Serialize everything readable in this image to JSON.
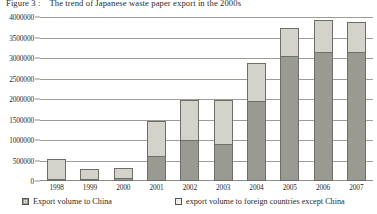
{
  "figure": {
    "caption_number": "Figure 3 :",
    "caption_text": "The trend of Japanese waste paper export in the 2000s"
  },
  "legend": {
    "china": "Export volume to China",
    "other": "export volume to foreign countries except China"
  },
  "axis": {
    "y_ticks": [
      "0",
      "500000",
      "1000000",
      "1500000",
      "2000000",
      "2500000",
      "3000000",
      "3500000",
      "4000000"
    ],
    "x_ticks": [
      "1998",
      "1999",
      "2000",
      "2001",
      "2002",
      "2003",
      "2004",
      "2005",
      "2006",
      "2007"
    ]
  },
  "colors": {
    "china": "#9a9a93",
    "other": "#d3d3cb",
    "grid": "#9d9d95",
    "outline": "#6e6e68",
    "text": "#2b2b2b"
  },
  "chart_data": {
    "type": "bar",
    "stacked": true,
    "xlabel": "",
    "ylabel": "",
    "ylim": [
      0,
      4000000
    ],
    "ytick_step": 500000,
    "grid": true,
    "legend_position": "bottom",
    "categories": [
      "1998",
      "1999",
      "2000",
      "2001",
      "2002",
      "2003",
      "2004",
      "2005",
      "2006",
      "2007"
    ],
    "series": [
      {
        "name": "Export volume to China",
        "color": "#9a9a93",
        "values": [
          50000,
          30000,
          70000,
          600000,
          1000000,
          900000,
          1950000,
          3050000,
          3150000,
          3150000
        ]
      },
      {
        "name": "export volume to foreign countries except China",
        "color": "#d3d3cb",
        "values": [
          500000,
          270000,
          280000,
          900000,
          1000000,
          1100000,
          950000,
          700000,
          800000,
          750000
        ]
      }
    ],
    "totals": [
      550000,
      300000,
      350000,
      1500000,
      2000000,
      2000000,
      2900000,
      3750000,
      3950000,
      3900000
    ]
  }
}
